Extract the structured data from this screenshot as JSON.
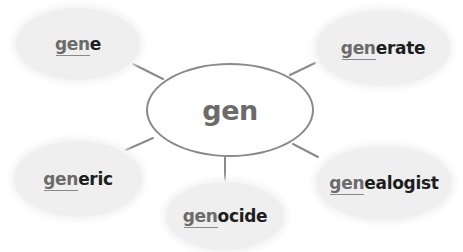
{
  "diagram": {
    "type": "word-web",
    "center": {
      "label": "gen"
    },
    "nodes": [
      {
        "root": "gen",
        "suffix": "e",
        "word": "gene",
        "position": "top-left"
      },
      {
        "root": "gen",
        "suffix": "erate",
        "word": "generate",
        "position": "top-right"
      },
      {
        "root": "gen",
        "suffix": "eric",
        "word": "generic",
        "position": "bottom-left"
      },
      {
        "root": "gen",
        "suffix": "ocide",
        "word": "genocide",
        "position": "bottom-center"
      },
      {
        "root": "gen",
        "suffix": "ealogist",
        "word": "genealogist",
        "position": "bottom-right"
      }
    ],
    "colors": {
      "root_text": "#6b6b6b",
      "suffix_text": "#1e1e1e",
      "bubble_fill": "#efefef",
      "lines": "#8a8a8a"
    }
  }
}
